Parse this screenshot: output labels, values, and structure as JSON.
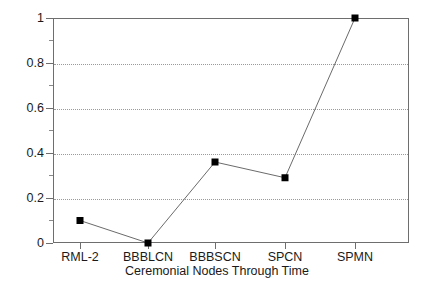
{
  "chart_data": {
    "type": "line",
    "title": "",
    "xlabel": "Ceremonial Nodes Through Time",
    "ylabel": "",
    "categories": [
      "RML-2",
      "BBBLCN",
      "BBBSCN",
      "SPCN",
      "SPMN"
    ],
    "values": [
      0.1,
      0.0,
      0.36,
      0.29,
      1.0
    ],
    "series": [
      {
        "name": "",
        "values": [
          0.1,
          0.0,
          0.36,
          0.29,
          1.0
        ]
      }
    ],
    "ylim": [
      0,
      1
    ],
    "y_ticks": [
      0,
      0.2,
      0.4,
      0.6,
      0.8,
      1
    ],
    "y_tick_labels": [
      "0",
      "0.2",
      "0.4",
      "0.6",
      "0.8",
      "1"
    ],
    "y_minor_ticks": [
      0.1,
      0.3,
      0.5,
      0.7,
      0.9
    ],
    "grid": true,
    "gridlines_at": [
      0.2,
      0.4,
      0.6,
      0.8
    ],
    "legend": false,
    "legend_position": "none",
    "marker": "square",
    "marker_color": "#000000",
    "line_color": "#6b6b6b",
    "frame_color": "#6e6e6e",
    "grid_color": "#9a9a9a",
    "background_color": "#ffffff"
  }
}
